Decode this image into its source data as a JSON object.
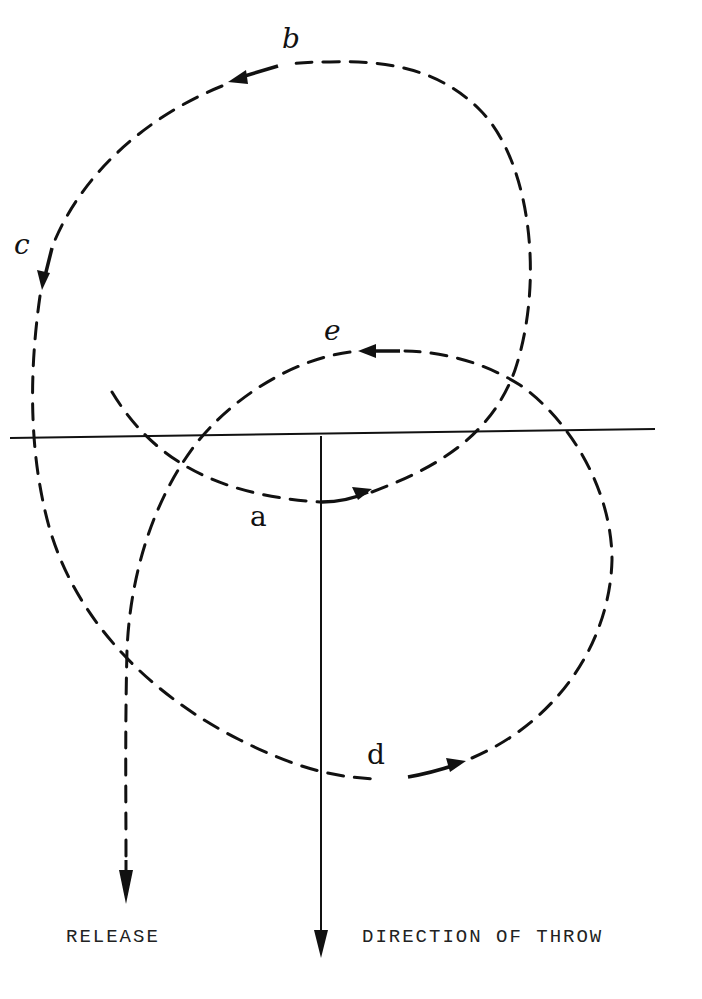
{
  "diagram": {
    "point_labels": {
      "a": "a",
      "b": "b",
      "c": "c",
      "d": "d",
      "e": "e"
    },
    "captions": {
      "release": "RELEASE",
      "direction": "DIRECTION OF THROW"
    }
  }
}
